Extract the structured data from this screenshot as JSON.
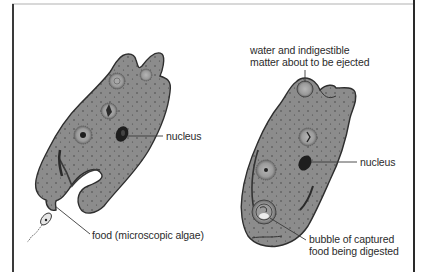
{
  "figure": {
    "title": "",
    "left_organism": {
      "name": "amoeba capturing food",
      "labels": {
        "nucleus": "nucleus",
        "food": "food (microscopic algae)"
      }
    },
    "right_organism": {
      "name": "amoeba digesting food",
      "labels": {
        "ejected_line1": "water and indigestible",
        "ejected_line2": "matter about to be ejected",
        "nucleus": "nucleus",
        "bubble_line1": "bubble of captured",
        "bubble_line2": "food being digested"
      }
    },
    "colors": {
      "body_fill": "#8a8a8a",
      "body_outline": "#2e2e2e",
      "nucleus": "#1e1e1e",
      "vacuole": "#a0a0a0",
      "leader_line": "#3a3a3a",
      "frame": "#333333"
    }
  }
}
